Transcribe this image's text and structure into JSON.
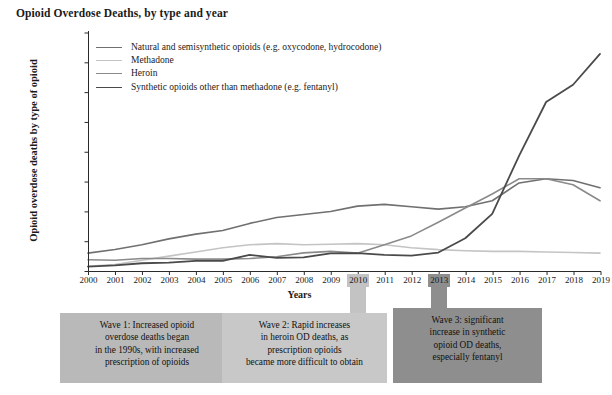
{
  "chart_data": {
    "type": "line",
    "title": "Opioid Overdose Deaths, by type and year",
    "xlabel": "Years",
    "ylabel": "Opioid overdose deaths by type of opioid",
    "x": [
      2000,
      2001,
      2002,
      2003,
      2004,
      2005,
      2006,
      2007,
      2008,
      2009,
      2010,
      2011,
      2012,
      2013,
      2014,
      2015,
      2016,
      2017,
      2018,
      2019
    ],
    "categories": [
      "2000",
      "2001",
      "2002",
      "2003",
      "2004",
      "2005",
      "2006",
      "2007",
      "2008",
      "2009",
      "2010",
      "2011",
      "2012",
      "2013",
      "2014",
      "2015",
      "2016",
      "2017",
      "2018",
      "2019"
    ],
    "ylim": [
      0,
      40000
    ],
    "yticks": [
      0,
      5000,
      10000,
      15000,
      20000,
      25000,
      30000,
      35000,
      40000
    ],
    "ytick_labels": [
      "0",
      "5000",
      "10000",
      "15000",
      "20000",
      "25000",
      "30000",
      "35000",
      "40000"
    ],
    "grid": false,
    "legend_position": "upper left",
    "series": [
      {
        "name": "Natural and semisynthetic opioids (e.g. oxycodone, hydrocodone)",
        "color": "#707070",
        "width": 1.6,
        "values": [
          3000,
          3600,
          4400,
          5400,
          6200,
          6800,
          8000,
          9000,
          9500,
          10000,
          10900,
          11200,
          10800,
          10400,
          10800,
          11800,
          14800,
          15500,
          15200,
          14000
        ]
      },
      {
        "name": "Methadone",
        "color": "#c4c4c4",
        "width": 1.6,
        "values": [
          800,
          1100,
          1800,
          2500,
          3200,
          3900,
          4400,
          4600,
          4400,
          4500,
          4600,
          4400,
          3900,
          3600,
          3400,
          3300,
          3300,
          3200,
          3100,
          3000
        ]
      },
      {
        "name": "Heroin",
        "color": "#8a8a8a",
        "width": 1.6,
        "values": [
          1900,
          1800,
          2100,
          2100,
          2000,
          2000,
          2100,
          2400,
          3050,
          3300,
          3000,
          4400,
          5900,
          8200,
          10600,
          12950,
          15500,
          15500,
          14500,
          11800
        ]
      },
      {
        "name": "Synthetic opioids other than methadone (e.g. fentanyl)",
        "color": "#4a4a4a",
        "width": 1.8,
        "values": [
          750,
          950,
          1300,
          1400,
          1700,
          1700,
          2700,
          2200,
          2300,
          2950,
          3000,
          2700,
          2600,
          3100,
          5500,
          9600,
          19400,
          28400,
          31300,
          36500
        ]
      }
    ],
    "highlighted_years": [
      {
        "year": "2010",
        "shade": "light"
      },
      {
        "year": "2013",
        "shade": "dark"
      }
    ],
    "annotations": [
      {
        "id": "wave-1",
        "text": "Wave 1: Increased opioid overdose deaths began in the 1990s, with increased prescription of opioids",
        "lines": [
          "Wave 1: Increased opioid",
          "overdose deaths began",
          "in the 1990s, with increased",
          "prescription of opioids"
        ],
        "color": "#b9b9b9"
      },
      {
        "id": "wave-2",
        "text": "Wave 2: Rapid increases in heroin OD deaths, as prescription opioids became more difficult to obtain",
        "lines": [
          "Wave 2: Rapid increases",
          "in heroin OD deaths, as",
          "prescription opioids",
          "became more difficult to obtain"
        ],
        "color": "#c8c8c8",
        "anchor_year": "2010"
      },
      {
        "id": "wave-3",
        "text": "Wave 3: significant increase in synthetic opioid OD deaths, especially fentanyl",
        "lines": [
          "Wave 3: significant",
          "increase in synthetic",
          "opioid OD deaths,",
          "especially fentanyl"
        ],
        "color": "#8e8e8e",
        "anchor_year": "2013"
      }
    ]
  }
}
